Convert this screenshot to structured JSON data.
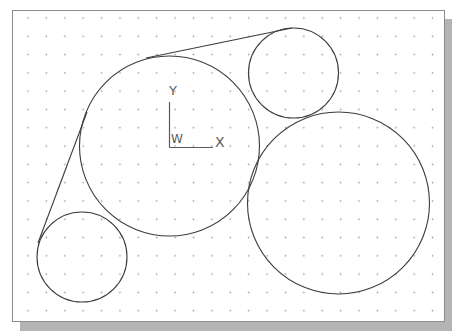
{
  "viewport": {
    "background": "#ffffff",
    "grid": {
      "spacing_x": 18.4,
      "spacing_y": 18.3,
      "dot_color": "#9a9a9a"
    },
    "frame_color": "#8c8c8c",
    "shadow_color": "#b4b4b4"
  },
  "ucs_icon": {
    "y_label": "Y",
    "x_label": "X",
    "w_label": "W"
  },
  "geometry": {
    "stroke_color": "#3c3c3c",
    "circles": [
      {
        "name": "large-circle",
        "cx": 169.5,
        "cy": 146,
        "r": 90
      },
      {
        "name": "top-right-small-circle",
        "cx": 293.5,
        "cy": 73,
        "r": 45
      },
      {
        "name": "bottom-left-small-circle",
        "cx": 82,
        "cy": 257,
        "r": 45
      },
      {
        "name": "right-large-circle",
        "cx": 338.5,
        "cy": 203,
        "r": 91
      }
    ],
    "lines": [
      {
        "name": "top-tangent-line",
        "x1": 146,
        "y1": 58,
        "x2": 292,
        "y2": 28
      },
      {
        "name": "left-tangent-line",
        "x1": 38,
        "y1": 243,
        "x2": 87,
        "y2": 112
      }
    ]
  }
}
